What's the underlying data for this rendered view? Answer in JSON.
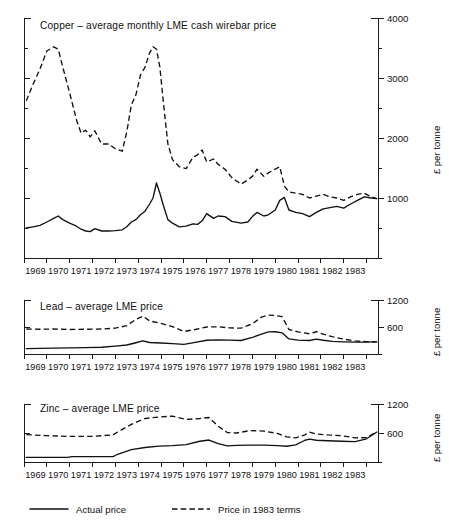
{
  "figure": {
    "background": "#ffffff",
    "ink": "#111111",
    "axis_title": "£ per tonne"
  },
  "legend": {
    "position": "bottom-left",
    "items": [
      {
        "label": "Actual price",
        "style": "solid",
        "key": "actual"
      },
      {
        "label": "Price in 1983 terms",
        "style": "dashed",
        "key": "real1983"
      }
    ]
  },
  "chart_data": [
    {
      "type": "line",
      "panel": "copper",
      "title": "Copper – average monthly LME cash wirebar price",
      "xlabel": "",
      "ylabel": "£ per tonne",
      "grid": false,
      "legend_position": "figure-bottom-left",
      "xlim": [
        1968.5,
        1984.0
      ],
      "ylim": [
        0,
        4000
      ],
      "xticks": [
        1968.5,
        1969.5,
        1970.5,
        1971.5,
        1972.5,
        1973.5,
        1974.5,
        1975.5,
        1976.5,
        1977.5,
        1978.5,
        1979.5,
        1980.5,
        1981.5,
        1982.5,
        1983.5
      ],
      "xticklabels": [
        "1969",
        "1970",
        "1971",
        "1972",
        "1973",
        "1974",
        "1975",
        "1976",
        "1977",
        "1978",
        "1979",
        "1980",
        "1981",
        "1982",
        "1983"
      ],
      "yticks": [
        0,
        500,
        1000,
        1500,
        2000,
        2500,
        3000,
        3500,
        4000
      ],
      "yticklabels": [
        "",
        "",
        "1000",
        "",
        "2000",
        "",
        "3000",
        "",
        "4000"
      ],
      "series": [
        {
          "name": "Actual price",
          "key": "actual",
          "style": "solid",
          "x": [
            1968.6,
            1968.9,
            1969.2,
            1969.5,
            1969.8,
            1970.0,
            1970.2,
            1970.5,
            1970.8,
            1971.0,
            1971.2,
            1971.4,
            1971.6,
            1971.9,
            1972.2,
            1972.5,
            1972.8,
            1973.0,
            1973.2,
            1973.4,
            1973.6,
            1973.8,
            1974.0,
            1974.15,
            1974.3,
            1974.45,
            1974.6,
            1974.8,
            1975.0,
            1975.3,
            1975.6,
            1975.9,
            1976.1,
            1976.3,
            1976.5,
            1976.8,
            1977.0,
            1977.3,
            1977.6,
            1978.0,
            1978.3,
            1978.5,
            1978.7,
            1979.0,
            1979.2,
            1979.5,
            1979.7,
            1979.9,
            1980.1,
            1980.4,
            1980.7,
            1981.0,
            1981.3,
            1981.6,
            1981.9,
            1982.2,
            1982.5,
            1982.8,
            1983.1,
            1983.4,
            1983.7,
            1983.95
          ],
          "y": [
            500,
            520,
            545,
            600,
            660,
            700,
            640,
            580,
            530,
            480,
            450,
            440,
            490,
            450,
            450,
            455,
            470,
            520,
            600,
            640,
            720,
            780,
            900,
            1000,
            1250,
            1080,
            880,
            640,
            580,
            520,
            530,
            570,
            560,
            620,
            740,
            660,
            700,
            690,
            610,
            580,
            600,
            690,
            760,
            700,
            720,
            800,
            960,
            1010,
            800,
            760,
            740,
            690,
            760,
            820,
            840,
            860,
            830,
            900,
            960,
            1020,
            1000,
            990
          ]
        },
        {
          "name": "Price in 1983 terms",
          "key": "real1983",
          "style": "dashed",
          "x": [
            1968.6,
            1968.9,
            1969.2,
            1969.5,
            1969.8,
            1970.0,
            1970.2,
            1970.5,
            1970.8,
            1971.0,
            1971.2,
            1971.4,
            1971.6,
            1971.9,
            1972.2,
            1972.5,
            1972.8,
            1973.0,
            1973.2,
            1973.4,
            1973.6,
            1973.8,
            1974.0,
            1974.15,
            1974.3,
            1974.45,
            1974.6,
            1974.8,
            1975.0,
            1975.3,
            1975.6,
            1975.9,
            1976.1,
            1976.3,
            1976.5,
            1976.8,
            1977.0,
            1977.3,
            1977.6,
            1978.0,
            1978.3,
            1978.5,
            1978.7,
            1979.0,
            1979.2,
            1979.5,
            1979.7,
            1979.9,
            1980.1,
            1980.4,
            1980.7,
            1981.0,
            1981.3,
            1981.6,
            1981.9,
            1982.2,
            1982.5,
            1982.8,
            1983.1,
            1983.4,
            1983.7,
            1983.95
          ],
          "y": [
            2620,
            2900,
            3150,
            3450,
            3520,
            3480,
            3180,
            2750,
            2300,
            2080,
            2130,
            2020,
            2120,
            1900,
            1900,
            1820,
            1780,
            2100,
            2550,
            2720,
            3050,
            3180,
            3420,
            3520,
            3480,
            3180,
            2600,
            1900,
            1640,
            1520,
            1490,
            1680,
            1720,
            1800,
            1600,
            1650,
            1560,
            1480,
            1340,
            1230,
            1300,
            1360,
            1480,
            1360,
            1420,
            1480,
            1520,
            1200,
            1100,
            1080,
            1060,
            1000,
            1030,
            1060,
            1020,
            1000,
            960,
            1020,
            1060,
            1080,
            1020,
            990
          ]
        }
      ]
    },
    {
      "type": "line",
      "panel": "lead",
      "title": "Lead – average LME price",
      "xlabel": "",
      "ylabel": "£ per tonne",
      "grid": false,
      "xlim": [
        1968.5,
        1984.0
      ],
      "ylim": [
        0,
        1200
      ],
      "xticks": [
        1968.5,
        1969.5,
        1970.5,
        1971.5,
        1972.5,
        1973.5,
        1974.5,
        1975.5,
        1976.5,
        1977.5,
        1978.5,
        1979.5,
        1980.5,
        1981.5,
        1982.5,
        1983.5
      ],
      "xticklabels": [
        "1969",
        "1970",
        "1971",
        "1972",
        "1973",
        "1974",
        "1975",
        "1976",
        "1977",
        "1978",
        "1979",
        "1980",
        "1981",
        "1982",
        "1983"
      ],
      "yticks": [
        0,
        600,
        1200
      ],
      "yticklabels": [
        "",
        "600",
        "1200"
      ],
      "series": [
        {
          "name": "Actual price",
          "key": "actual",
          "style": "solid",
          "x": [
            1968.6,
            1969.2,
            1969.8,
            1970.5,
            1971.2,
            1971.9,
            1972.5,
            1973.0,
            1973.4,
            1973.7,
            1974.0,
            1974.5,
            1975.0,
            1975.5,
            1976.0,
            1976.5,
            1977.0,
            1977.5,
            1978.0,
            1978.5,
            1978.9,
            1979.2,
            1979.5,
            1979.8,
            1980.1,
            1980.5,
            1981.0,
            1981.3,
            1981.6,
            1982.0,
            1982.5,
            1983.0,
            1983.5,
            1983.95
          ],
          "y": [
            120,
            125,
            130,
            135,
            140,
            150,
            175,
            200,
            250,
            290,
            255,
            245,
            230,
            215,
            260,
            305,
            315,
            310,
            300,
            370,
            440,
            490,
            495,
            470,
            335,
            310,
            300,
            330,
            305,
            280,
            270,
            265,
            265,
            270
          ]
        },
        {
          "name": "Price in 1983 terms",
          "key": "real1983",
          "style": "dashed",
          "x": [
            1968.6,
            1969.2,
            1969.8,
            1970.5,
            1971.2,
            1971.9,
            1972.5,
            1973.0,
            1973.4,
            1973.7,
            1974.0,
            1974.5,
            1975.0,
            1975.5,
            1976.0,
            1976.5,
            1977.0,
            1977.5,
            1978.0,
            1978.5,
            1978.9,
            1979.2,
            1979.5,
            1979.8,
            1980.1,
            1980.5,
            1981.0,
            1981.3,
            1981.6,
            1982.0,
            1982.5,
            1983.0,
            1983.5,
            1983.95
          ],
          "y": [
            555,
            550,
            555,
            545,
            550,
            555,
            575,
            630,
            770,
            840,
            735,
            680,
            610,
            500,
            545,
            600,
            605,
            580,
            575,
            670,
            820,
            865,
            855,
            830,
            545,
            490,
            450,
            495,
            440,
            385,
            330,
            290,
            275,
            270
          ]
        }
      ]
    },
    {
      "type": "line",
      "panel": "zinc",
      "title": "Zinc – average LME price",
      "xlabel": "",
      "ylabel": "£ per tonne",
      "grid": false,
      "xlim": [
        1968.5,
        1984.0
      ],
      "ylim": [
        0,
        1200
      ],
      "xticks": [
        1968.5,
        1969.5,
        1970.5,
        1971.5,
        1972.5,
        1973.5,
        1974.5,
        1975.5,
        1976.5,
        1977.5,
        1978.5,
        1979.5,
        1980.5,
        1981.5,
        1982.5,
        1983.5
      ],
      "xticklabels": [
        "1969",
        "1970",
        "1971",
        "1972",
        "1973",
        "1974",
        "1975",
        "1976",
        "1977",
        "1978",
        "1979",
        "1980",
        "1981",
        "1982",
        "1983"
      ],
      "yticks": [
        0,
        600,
        1200
      ],
      "yticklabels": [
        "",
        "600",
        "1200"
      ],
      "series": [
        {
          "name": "Actual price",
          "key": "actual",
          "style": "solid",
          "x": [
            1968.6,
            1969.5,
            1970.4,
            1970.6,
            1971.5,
            1972.4,
            1972.6,
            1973.2,
            1973.8,
            1974.4,
            1975.0,
            1975.6,
            1976.2,
            1976.6,
            1977.0,
            1977.4,
            1977.8,
            1978.4,
            1979.0,
            1979.6,
            1980.0,
            1980.4,
            1980.8,
            1981.0,
            1981.3,
            1981.8,
            1982.4,
            1983.0,
            1983.5,
            1983.95
          ],
          "y": [
            95,
            95,
            95,
            110,
            110,
            110,
            160,
            255,
            300,
            330,
            340,
            360,
            430,
            455,
            380,
            335,
            345,
            350,
            350,
            340,
            325,
            355,
            450,
            475,
            450,
            440,
            430,
            420,
            480,
            620
          ]
        },
        {
          "name": "Price in 1983 terms",
          "key": "real1983",
          "style": "dashed",
          "x": [
            1968.6,
            1969.5,
            1970.4,
            1970.6,
            1971.5,
            1972.4,
            1972.6,
            1973.2,
            1973.8,
            1974.4,
            1975.0,
            1975.6,
            1976.2,
            1976.6,
            1977.0,
            1977.4,
            1977.8,
            1978.4,
            1979.0,
            1979.6,
            1980.0,
            1980.4,
            1980.8,
            1981.0,
            1981.3,
            1981.8,
            1982.4,
            1983.0,
            1983.5,
            1983.95
          ],
          "y": [
            565,
            545,
            530,
            530,
            530,
            560,
            620,
            780,
            900,
            930,
            950,
            880,
            900,
            920,
            740,
            610,
            600,
            650,
            640,
            590,
            520,
            500,
            560,
            620,
            580,
            560,
            545,
            500,
            505,
            625
          ]
        }
      ]
    }
  ]
}
